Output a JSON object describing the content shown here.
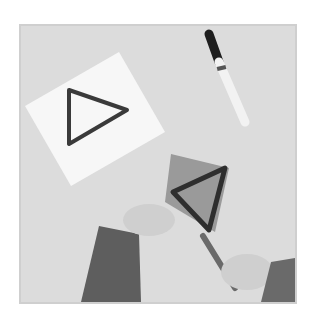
{
  "image": {
    "description": "Grayscale photo: white card with drawn triangle, marker, hands cutting a triangle from a speckled sponge with scissors",
    "colors": {
      "background": "#ffffff",
      "table": "#dcdcdc",
      "card": "#f7f7f7",
      "ink": "#3a3a3a",
      "sponge": "#9a9a9a",
      "sleeve": "#5e5e5e",
      "skin": "#cfcfcf"
    }
  }
}
